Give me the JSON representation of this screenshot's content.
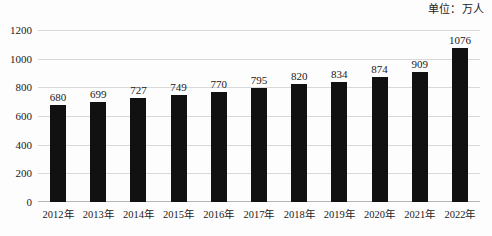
{
  "unit_caption": "单位：万人",
  "chart_data": {
    "type": "bar",
    "title": "",
    "subtitle": "",
    "xlabel": "",
    "ylabel": "",
    "unit_note": "单位：万人",
    "categories": [
      "2012年",
      "2013年",
      "2014年",
      "2015年",
      "2016年",
      "2017年",
      "2018年",
      "2019年",
      "2020年",
      "2021年",
      "2022年"
    ],
    "values": [
      680,
      699,
      727,
      749,
      770,
      795,
      820,
      834,
      874,
      909,
      1076
    ],
    "data_labels": [
      "680",
      "699",
      "727",
      "749",
      "770",
      "795",
      "820",
      "834",
      "874",
      "909",
      "1076"
    ],
    "ylim": [
      0,
      1200
    ],
    "yticks": [
      0,
      200,
      400,
      600,
      800,
      1000,
      1200
    ],
    "ytick_labels": [
      "0",
      "200",
      "400",
      "600",
      "800",
      "1000",
      "1200"
    ],
    "grid": true,
    "grid_axis": "y",
    "legend": false,
    "legend_position": "none",
    "bar_color": "#111111",
    "grid_color": "#d9d9d9",
    "axis_color": "#b5b5b5",
    "background_color": "#fdfdfd",
    "text_color": "#1a1a1a",
    "series": [
      {
        "name": "",
        "values": [
          680,
          699,
          727,
          749,
          770,
          795,
          820,
          834,
          874,
          909,
          1076
        ]
      }
    ]
  }
}
